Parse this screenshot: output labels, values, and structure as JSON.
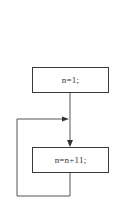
{
  "diagram": {
    "type": "flowchart",
    "nodes": [
      {
        "id": "init",
        "label": "n=1;"
      },
      {
        "id": "update",
        "label": "n=n+11;"
      }
    ],
    "edges": [
      {
        "from": "init",
        "to": "update"
      },
      {
        "from": "update",
        "to": "update",
        "kind": "loop-back"
      }
    ],
    "colors": {
      "line": "#3a3a3a",
      "background": "#ffffff"
    }
  }
}
